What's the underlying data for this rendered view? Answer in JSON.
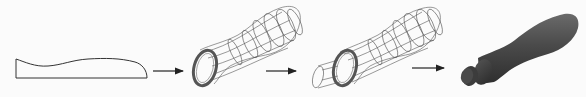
{
  "diagram": {
    "steps": [
      {
        "id": "profile",
        "kind": "2d-profile-sketch"
      },
      {
        "id": "wireframe-revolve",
        "kind": "wireframe-body"
      },
      {
        "id": "wireframe-with-shaft",
        "kind": "wireframe-body-with-shaft"
      },
      {
        "id": "solid",
        "kind": "shaded-solid"
      }
    ],
    "arrows": 3,
    "colors": {
      "background": "#fbfbfb",
      "line": "#333333",
      "wire": "#555555",
      "ring": "#6a6a6a",
      "solid_dark": "#3a3a3a",
      "solid_mid": "#5a5a5a"
    }
  }
}
